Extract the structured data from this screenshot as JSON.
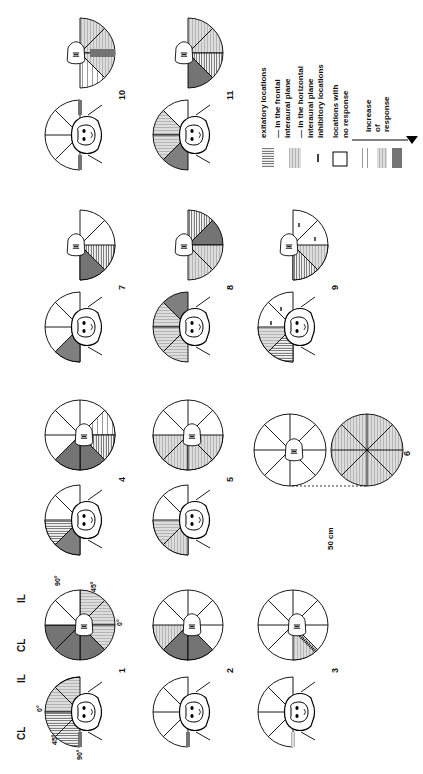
{
  "figure": {
    "orientation": "rotated 90deg counter-clockwise",
    "column_labels": [
      "CL",
      "IL",
      "CL",
      "IL"
    ],
    "angle_labels_panel1_left": [
      "0°",
      "45°",
      "90°"
    ],
    "angle_labels_panel1_right": [
      "90°",
      "45°",
      "0°"
    ],
    "panels": [
      {
        "number": "1",
        "label": "1"
      },
      {
        "number": "2",
        "label": "2"
      },
      {
        "number": "3",
        "label": "3"
      },
      {
        "number": "4",
        "label": "4"
      },
      {
        "number": "5",
        "label": "5"
      },
      {
        "number": "6",
        "label": "6"
      },
      {
        "number": "7",
        "label": "7"
      },
      {
        "number": "8",
        "label": "8"
      },
      {
        "number": "9",
        "label": "9"
      },
      {
        "number": "10",
        "label": "10"
      },
      {
        "number": "11",
        "label": "11"
      }
    ],
    "distance_label": "50 cm"
  },
  "legend": {
    "excitatory_title": "exitatory locations",
    "frontal_1": "— in the frontal",
    "frontal_2": "interaural plane",
    "horizontal_1": "— in the horizontal",
    "horizontal_2": "interaural plane",
    "inhibitory": "inhibitory locations",
    "noresp_1": "locations with",
    "noresp_2": "no response",
    "increase_1": "increase",
    "increase_2": "of",
    "increase_3": "response"
  }
}
